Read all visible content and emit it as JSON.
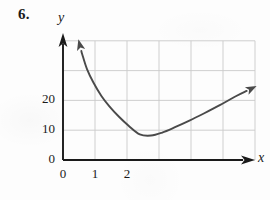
{
  "figure": {
    "exercise_number": "6.",
    "x_axis_label": "x",
    "y_axis_label": "y"
  },
  "chart_data": {
    "type": "line",
    "title": "",
    "subtitle": "",
    "xlabel": "x",
    "ylabel": "y",
    "xlim": [
      0,
      6
    ],
    "ylim": [
      0,
      40
    ],
    "grid": true,
    "legend": null,
    "x_ticks": [
      "0",
      "1",
      "2"
    ],
    "x_tick_values": [
      0,
      1,
      2
    ],
    "y_ticks": [
      "0",
      "10",
      "20"
    ],
    "y_tick_values": [
      0,
      10,
      20
    ],
    "gridline_x_values": [
      0,
      1,
      2,
      3,
      4,
      5,
      6
    ],
    "gridline_y_values": [
      0,
      10,
      20,
      30,
      40
    ],
    "series": [
      {
        "name": "curve",
        "color": "#4a4a4a",
        "arrow_start": true,
        "arrow_end": true,
        "x": [
          0.48,
          0.6,
          0.75,
          0.95,
          1.2,
          1.45,
          1.75,
          2.05,
          2.4,
          2.75,
          3.1,
          3.5,
          3.95,
          4.4,
          4.9,
          5.4,
          6.05
        ],
        "y": [
          40.5,
          35.5,
          30.5,
          26.0,
          21.5,
          18.0,
          14.5,
          11.5,
          8.6,
          8.2,
          9.2,
          11.0,
          13.2,
          15.6,
          18.4,
          21.4,
          24.8
        ]
      }
    ],
    "annotations": [
      {
        "text": "6.",
        "kind": "exercise-number"
      }
    ]
  },
  "colors": {
    "axis": "#1a1a1a",
    "grid": "#c9c9c9",
    "curve": "#4a4a4a",
    "background": "#fdfdfd",
    "text": "#1a1a1a"
  }
}
